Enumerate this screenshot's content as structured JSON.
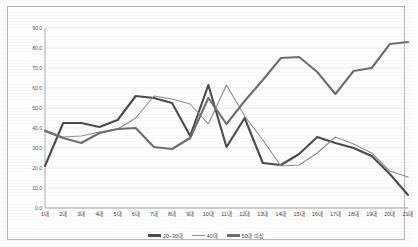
{
  "chart_data": {
    "type": "line",
    "title": "",
    "subtitle": "",
    "xlabel": "",
    "ylabel": "",
    "grid": true,
    "legend_position": "bottom",
    "ylim": [
      0.0,
      90.0
    ],
    "yticks": [
      "0.0",
      "10.0",
      "20.0",
      "30.0",
      "40.0",
      "50.0",
      "60.0",
      "70.0",
      "80.0",
      "90.0"
    ],
    "ytick_values": [
      0,
      10,
      20,
      30,
      40,
      50,
      60,
      70,
      80,
      90
    ],
    "categories": [
      "1대",
      "2대",
      "3대",
      "4대",
      "5대",
      "6대",
      "7대",
      "8대",
      "9대",
      "10대",
      "11대",
      "12대",
      "13대",
      "14대",
      "15대",
      "16대",
      "17대",
      "18대",
      "19대",
      "20대",
      "21대"
    ],
    "series": [
      {
        "name": "20~30대",
        "color": "#4c4c4c",
        "width": 2.1,
        "values": [
          21.0,
          42.5,
          42.5,
          40.5,
          44.0,
          56.0,
          55.0,
          52.5,
          36.0,
          61.5,
          30.5,
          45.0,
          22.5,
          21.5,
          27.0,
          35.5,
          32.5,
          30.0,
          26.0,
          17.0,
          6.5
        ]
      },
      {
        "name": "40대",
        "color": "#8f8f8f",
        "width": 1.1,
        "values": [
          39.0,
          35.5,
          36.0,
          38.0,
          39.5,
          45.0,
          56.0,
          54.5,
          52.0,
          42.0,
          61.5,
          46.0,
          34.0,
          21.0,
          21.5,
          27.5,
          35.5,
          32.0,
          27.5,
          18.5,
          15.5
        ]
      },
      {
        "name": "50대 이상",
        "color": "#6f6f6f",
        "width": 2.1,
        "values": [
          38.5,
          35.0,
          32.5,
          37.5,
          39.5,
          40.0,
          30.5,
          29.5,
          35.0,
          55.0,
          42.0,
          53.5,
          64.0,
          75.0,
          75.5,
          68.0,
          57.0,
          68.5,
          70.0,
          82.0,
          83.0
        ]
      }
    ]
  },
  "legend": {
    "items": [
      {
        "label": "20~30대"
      },
      {
        "label": "40대"
      },
      {
        "label": "50대 이상"
      }
    ]
  }
}
